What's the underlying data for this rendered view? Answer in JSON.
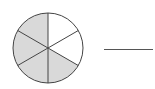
{
  "figure": {
    "total_parts": 6,
    "shaded_parts": 4,
    "shaded_color": "#d9d9d9",
    "unshaded_color": "#ffffff",
    "stroke_color": "#444444",
    "answer_blank": ""
  }
}
